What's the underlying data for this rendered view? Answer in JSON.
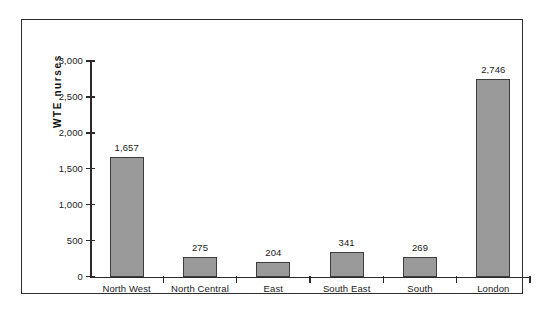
{
  "chart_data": {
    "type": "bar",
    "title": "",
    "subtitle": "",
    "xlabel": "",
    "ylabel": "WTE  nurses",
    "categories": [
      "North West",
      "North Central",
      "East",
      "South East",
      "South",
      "London"
    ],
    "values": [
      1657,
      275,
      204,
      341,
      269,
      2746
    ],
    "value_labels": [
      "1,657",
      "275",
      "204",
      "341",
      "269",
      "2,746"
    ],
    "ylim": [
      0,
      3000
    ],
    "ytick_values": [
      0,
      500,
      1000,
      1500,
      2000,
      2500,
      3000
    ],
    "ytick_labels": [
      "0",
      "500",
      "1,000",
      "1,500",
      "2,000",
      "2,500",
      "3,000"
    ],
    "grid": false,
    "legend": null,
    "legend_position": "none",
    "series": [
      {
        "name": "WTE nurses",
        "values": [
          1657,
          275,
          204,
          341,
          269,
          2746
        ]
      }
    ],
    "colors": {
      "bar_fill": "#9a9a9a",
      "bar_edge": "#3d3d3d",
      "axis": "#2b2b2b",
      "text": "#1a1a1a",
      "frame": "#2e2e2e",
      "background": "#ffffff"
    }
  }
}
